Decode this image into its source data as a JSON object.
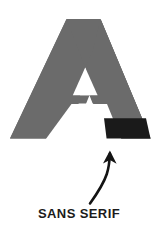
{
  "figure": {
    "name": "sans-serif-letter-diagram",
    "background_color": "#ffffff",
    "width": 158,
    "height": 238
  },
  "letter": {
    "glyph": "A",
    "style_label": "sans serif",
    "body_color": "#6b6b6b",
    "counter_color": "#ffffff",
    "highlight_color": "#1a1a1a",
    "highlight_description": "bottom right leg terminal"
  },
  "annotation": {
    "arrow": {
      "icon_name": "curved-up-arrow-icon",
      "color": "#141414",
      "direction": "up",
      "points_to": "letter-highlight-terminal"
    },
    "caption": "SANS SERIF",
    "caption_color": "#1b1b1b"
  }
}
